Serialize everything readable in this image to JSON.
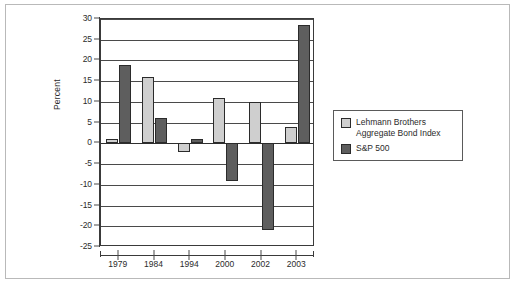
{
  "chart_data": {
    "type": "bar",
    "title": "",
    "xlabel": "",
    "ylabel": "Percent",
    "categories": [
      "1979",
      "1984",
      "1994",
      "2000",
      "2002",
      "2003"
    ],
    "series": [
      {
        "name": "Lehmann Brothers Aggregate Bond Index",
        "color": "#cfcfcf",
        "values": [
          1,
          16,
          -2,
          11,
          10,
          4
        ]
      },
      {
        "name": "S&P 500",
        "color": "#5e5e5e",
        "values": [
          19,
          6,
          1,
          -9,
          -21,
          28.5
        ]
      }
    ],
    "ylim": [
      -25,
      30
    ],
    "yticks": [
      30,
      25,
      20,
      15,
      10,
      5,
      0,
      -5,
      -10,
      -15,
      -20,
      -25
    ],
    "ytick_labels": [
      "30",
      "25",
      "20",
      "15",
      "10",
      "5",
      "0",
      "-5",
      "-10",
      "-15",
      "-20",
      "-25"
    ],
    "grid": true,
    "legend_position": "right"
  },
  "legend": {
    "entries": [
      {
        "label": "Lehmann Brothers\nAggregate Bond Index",
        "swatch": "light"
      },
      {
        "label": "S&P 500",
        "swatch": "dark"
      }
    ]
  },
  "axis": {
    "y_title": "Percent"
  },
  "colors": {
    "series_light": "#cfcfcf",
    "series_dark": "#5e5e5e",
    "axis": "#3a3a3a",
    "grid": "#4a4a4a",
    "frame": "#b9b9b9",
    "background": "#ffffff"
  }
}
